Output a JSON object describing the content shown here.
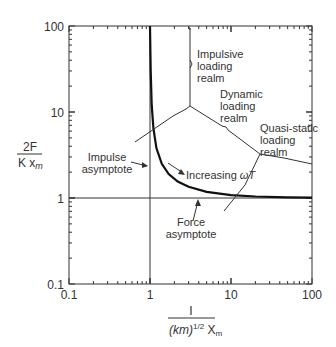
{
  "chart_data": {
    "type": "line",
    "title": "",
    "xlabel": "I / ((km)^1/2 X_m)",
    "ylabel": "2F / (K x_m)",
    "xscale": "log",
    "yscale": "log",
    "xlim": [
      0.1,
      100
    ],
    "ylim": [
      0.1,
      100
    ],
    "x_ticks": [
      "0.1",
      "1",
      "10",
      "100"
    ],
    "y_ticks": [
      "0.1",
      "1",
      "10",
      "100"
    ],
    "grid": false,
    "series": [
      {
        "name": "Response curve",
        "x": [
          1.0,
          1.02,
          1.05,
          1.1,
          1.2,
          1.4,
          1.7,
          2.2,
          3,
          5,
          10,
          20,
          50,
          100
        ],
        "y": [
          100,
          30,
          12,
          6.5,
          3.8,
          2.5,
          1.9,
          1.55,
          1.35,
          1.18,
          1.08,
          1.04,
          1.02,
          1.01
        ]
      },
      {
        "name": "Impulse asymptote",
        "x": [
          1,
          1
        ],
        "y": [
          0.1,
          100
        ]
      },
      {
        "name": "Force asymptote",
        "x": [
          0.1,
          100
        ],
        "y": [
          1,
          1
        ]
      }
    ],
    "annotations": [
      {
        "text": "Impulsive loading realm"
      },
      {
        "text": "Dynamic loading realm"
      },
      {
        "text": "Quasi-static loading realm"
      },
      {
        "text": "Impulse asymptote"
      },
      {
        "text": "Force asymptote"
      },
      {
        "text": "Increasing ωT"
      }
    ]
  },
  "labels": {
    "y_num": "2F",
    "y_den_k": "K x",
    "y_den_sub": "m",
    "x_num": "I",
    "x_den_a": "(km)",
    "x_den_sup": "1/2",
    "x_den_b": " X",
    "x_den_sub": "m",
    "impulsive": [
      "Impulsive",
      "loading",
      "realm"
    ],
    "dynamic": [
      "Dynamic",
      "loading",
      "realm"
    ],
    "quasi": [
      "Quasi-static",
      "loading",
      "realm"
    ],
    "impulse_asym": [
      "Impulse",
      "asymptote"
    ],
    "force_asym": [
      "Force",
      "asymptote"
    ],
    "increasing": "Increasing ",
    "omega_t": "ωT",
    "ticks": {
      "x0": "0.1",
      "x1": "1",
      "x2": "10",
      "x3": "100",
      "y0": "0.1",
      "y1": "1",
      "y2": "10",
      "y3": "100"
    }
  }
}
